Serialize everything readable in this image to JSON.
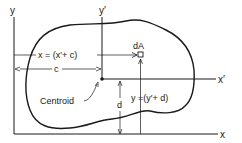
{
  "diagram": {
    "colors": {
      "ink": "#1a1a1a",
      "background": "#ffffff"
    },
    "axes": {
      "y_label": "y",
      "x_label": "x",
      "y_prime_label": "y′",
      "x_prime_label": "x′"
    },
    "labels": {
      "dA": "dA",
      "x_relation": "x = (x′+ c)",
      "c": "c",
      "d": "d",
      "y_relation": "y =(y′+ d)",
      "centroid": "Centroid"
    }
  }
}
